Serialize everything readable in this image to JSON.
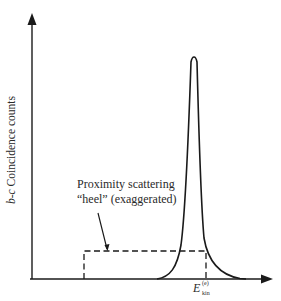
{
  "figure": {
    "y_axis": {
      "label_prefix": "b",
      "label_sep": "-",
      "label_var": "c",
      "label_rest": " Coincidence counts"
    },
    "x_axis": {
      "label_symbol": "E",
      "label_superscript": "(e)",
      "label_subscript": "kin"
    },
    "annotation": {
      "line1": "Proximity scattering",
      "line2": "“heel” (exaggerated)"
    },
    "colors": {
      "stroke": "#1a1a1a",
      "background": "#ffffff"
    },
    "elements": {
      "peak": "sharp coincidence peak at E_kin^(e)",
      "heel_region": "dashed rectangle representing proximity scattering heel"
    }
  }
}
